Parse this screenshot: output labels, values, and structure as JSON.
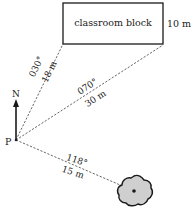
{
  "diagram": {
    "origin_label": "P",
    "north_label": "N",
    "building": {
      "label": "classroom block",
      "width_label": "10 m"
    },
    "bearings": [
      {
        "target": "classroom block left corner",
        "bearing": "030°",
        "distance": "18 m"
      },
      {
        "target": "classroom block right corner",
        "bearing": "070°",
        "distance": "30 m"
      },
      {
        "target": "tree",
        "bearing": "118°",
        "distance": "15 m"
      }
    ],
    "tree": {
      "label": "tree"
    },
    "colors": {
      "line": "#1a1a1a",
      "dashed": "#555555",
      "tree_fill": "#cfcfcf"
    }
  }
}
